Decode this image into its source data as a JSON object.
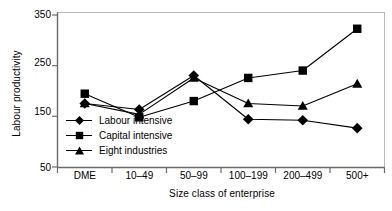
{
  "chart_data": {
    "type": "line",
    "title": "",
    "xlabel": "Size class of enterprise",
    "ylabel": "Labour productivity",
    "categories": [
      "DME",
      "10–49",
      "50–99",
      "100–199",
      "200–499",
      "500+"
    ],
    "ylim": [
      50,
      365
    ],
    "yticks": [
      50,
      150,
      250,
      350
    ],
    "yticklabels": [
      "50",
      "150",
      "250",
      "350"
    ],
    "grid": false,
    "legend_position": "inside-lower-left",
    "series": [
      {
        "name": "Labour intensive",
        "marker": "diamond",
        "color": "#000000",
        "values": [
          180,
          168,
          237,
          148,
          146,
          130
        ]
      },
      {
        "name": "Capital intensive",
        "marker": "square",
        "color": "#000000",
        "values": [
          200,
          152,
          185,
          232,
          247,
          332
        ]
      },
      {
        "name": "Eight industries",
        "marker": "triangle",
        "color": "#000000",
        "values": [
          180,
          158,
          232,
          180,
          175,
          220
        ]
      }
    ]
  },
  "axis": {
    "y_label": "Labour productivity",
    "x_label": "Size class of enterprise",
    "y_tick_0": "50",
    "y_tick_1": "150",
    "y_tick_2": "250",
    "y_tick_3": "350",
    "x_tick_0": "DME",
    "x_tick_1": "10–49",
    "x_tick_2": "50–99",
    "x_tick_3": "100–199",
    "x_tick_4": "200–499",
    "x_tick_5": "500+"
  },
  "legend": {
    "item_0": "Labour intensive",
    "item_1": "Capital intensive",
    "item_2": "Eight industries"
  }
}
